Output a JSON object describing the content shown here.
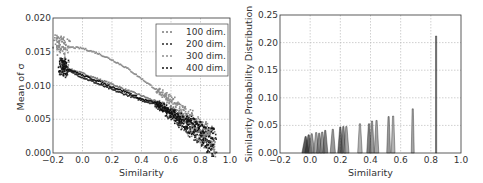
{
  "chart_data": [
    {
      "type": "scatter",
      "title": "",
      "xlabel": "Similarity",
      "ylabel": "Mean of σ",
      "xlim": [
        -0.2,
        1.0
      ],
      "ylim": [
        0.0,
        0.02
      ],
      "xticks": [
        "−0.2",
        "0.0",
        "0.2",
        "0.4",
        "0.6",
        "0.8",
        "1.0"
      ],
      "yticks": [
        "0.000",
        "0.005",
        "0.010",
        "0.015",
        "0.020"
      ],
      "grid": true,
      "legend_position": "upper right",
      "series": [
        {
          "name": "100 dim.",
          "color": "#7a7a7a",
          "x": [
            -0.15,
            -0.1,
            0.0,
            0.1,
            0.2,
            0.3,
            0.4,
            0.5,
            0.6,
            0.7,
            0.8,
            0.9
          ],
          "y": [
            0.0135,
            0.0125,
            0.0118,
            0.011,
            0.0102,
            0.0093,
            0.0085,
            0.0076,
            0.0062,
            0.0045,
            0.003,
            0.0015
          ]
        },
        {
          "name": "200 dim.",
          "color": "#2a2a2a",
          "x": [
            -0.15,
            -0.1,
            0.0,
            0.1,
            0.2,
            0.3,
            0.4,
            0.5,
            0.6,
            0.7,
            0.8,
            0.9
          ],
          "y": [
            0.0128,
            0.0122,
            0.0112,
            0.0103,
            0.0094,
            0.0086,
            0.0078,
            0.0072,
            0.0058,
            0.0042,
            0.0028,
            0.0012
          ]
        },
        {
          "name": "300 dim.",
          "color": "#8c8c8c",
          "x": [
            -0.18,
            -0.15,
            -0.1,
            0.0,
            0.1,
            0.2,
            0.3,
            0.4,
            0.5,
            0.6,
            0.7,
            0.8,
            0.9
          ],
          "y": [
            0.0165,
            0.016,
            0.0157,
            0.0155,
            0.0148,
            0.0138,
            0.0126,
            0.011,
            0.0094,
            0.0078,
            0.0055,
            0.0035,
            0.0015
          ]
        },
        {
          "name": "400 dim.",
          "color": "#101010",
          "x": [
            -0.15,
            -0.1,
            0.0,
            0.1,
            0.2,
            0.3,
            0.4,
            0.5,
            0.6,
            0.7,
            0.8,
            0.9
          ],
          "y": [
            0.013,
            0.0125,
            0.0115,
            0.0107,
            0.0098,
            0.009,
            0.008,
            0.0074,
            0.006,
            0.0044,
            0.003,
            0.0013
          ]
        }
      ]
    },
    {
      "type": "area",
      "title": "",
      "xlabel": "Similarity",
      "ylabel": "Similarity Probability Distribution",
      "xlim": [
        -0.2,
        1.0
      ],
      "ylim": [
        0.0,
        0.25
      ],
      "xticks": [
        "−0.2",
        "0.0",
        "0.2",
        "0.4",
        "0.6",
        "0.8",
        "1.0"
      ],
      "yticks": [
        "0.00",
        "0.05",
        "0.10",
        "0.15",
        "0.20",
        "0.25"
      ],
      "grid": true,
      "peaks": [
        {
          "center": -0.03,
          "height": 0.03,
          "width": 0.05,
          "color": "#222222"
        },
        {
          "center": -0.01,
          "height": 0.033,
          "width": 0.05,
          "color": "#333333"
        },
        {
          "center": 0.01,
          "height": 0.035,
          "width": 0.04,
          "color": "#777777"
        },
        {
          "center": 0.04,
          "height": 0.037,
          "width": 0.035,
          "color": "#888888"
        },
        {
          "center": 0.06,
          "height": 0.036,
          "width": 0.035,
          "color": "#666666"
        },
        {
          "center": 0.08,
          "height": 0.038,
          "width": 0.035,
          "color": "#7a7a7a"
        },
        {
          "center": 0.1,
          "height": 0.041,
          "width": 0.035,
          "color": "#555555"
        },
        {
          "center": 0.15,
          "height": 0.043,
          "width": 0.035,
          "color": "#777777"
        },
        {
          "center": 0.2,
          "height": 0.047,
          "width": 0.035,
          "color": "#333333"
        },
        {
          "center": 0.22,
          "height": 0.048,
          "width": 0.035,
          "color": "#555555"
        },
        {
          "center": 0.24,
          "height": 0.048,
          "width": 0.035,
          "color": "#888888"
        },
        {
          "center": 0.33,
          "height": 0.053,
          "width": 0.03,
          "color": "#9a9a9a"
        },
        {
          "center": 0.39,
          "height": 0.053,
          "width": 0.03,
          "color": "#555555"
        },
        {
          "center": 0.41,
          "height": 0.058,
          "width": 0.03,
          "color": "#777777"
        },
        {
          "center": 0.44,
          "height": 0.059,
          "width": 0.03,
          "color": "#888888"
        },
        {
          "center": 0.52,
          "height": 0.066,
          "width": 0.025,
          "color": "#777777"
        },
        {
          "center": 0.55,
          "height": 0.067,
          "width": 0.025,
          "color": "#999999"
        },
        {
          "center": 0.68,
          "height": 0.08,
          "width": 0.02,
          "color": "#888888"
        },
        {
          "center": 0.835,
          "height": 0.212,
          "width": 0.008,
          "color": "#333333"
        }
      ]
    }
  ]
}
